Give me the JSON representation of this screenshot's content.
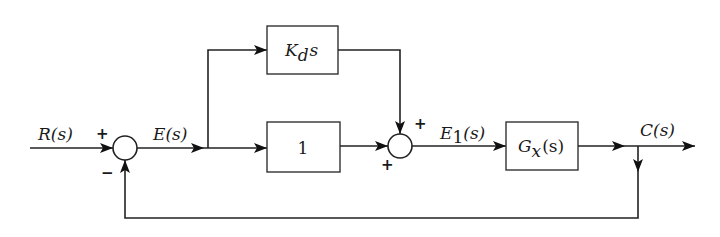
{
  "diagram": {
    "type": "block-diagram",
    "signals": {
      "input": "R(s)",
      "error": "E(s)",
      "error1": "E1(s)",
      "output": "C(s)"
    },
    "blocks": {
      "derivative": {
        "main": "K",
        "sub": "d",
        "tail": "s"
      },
      "proportional": {
        "text": "1"
      },
      "plant": {
        "main": "G",
        "sub": "x",
        "tail": "(s)"
      }
    },
    "summing_junctions": {
      "sum1": {
        "input_sign": "+",
        "feedback_sign": "−"
      },
      "sum2": {
        "top_sign": "+",
        "left_sign": "+"
      }
    },
    "labels": {
      "R_main": "R(s)",
      "E_main": "E(s)",
      "E1_main": "E",
      "E1_sub": "1",
      "E1_tail": "(s)",
      "C_main": "C(s)"
    },
    "colors": {
      "line": "#222222",
      "background": "#ffffff"
    }
  }
}
